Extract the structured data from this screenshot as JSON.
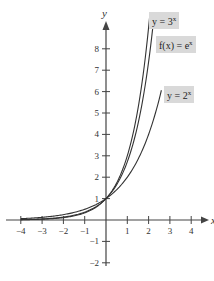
{
  "chart_data": {
    "type": "line",
    "title": "",
    "xlabel": "x",
    "ylabel": "y",
    "xlim": [
      -4.5,
      4.7
    ],
    "ylim": [
      -2.2,
      9.5
    ],
    "x_ticks": [
      -4,
      -3,
      -2,
      -1,
      1,
      2,
      3,
      4
    ],
    "x_tick_labels": [
      "−4",
      "−3",
      "−2",
      "−1",
      "1",
      "2",
      "3",
      "4"
    ],
    "y_ticks": [
      -2,
      -1,
      1,
      2,
      3,
      4,
      5,
      6,
      7,
      8
    ],
    "y_tick_labels": [
      "−2",
      "−1",
      "1",
      "2",
      "3",
      "4",
      "5",
      "6",
      "7",
      "8"
    ],
    "grid": false,
    "legend": "inline labels near curve ends (top right)",
    "series": [
      {
        "name": "y = 3^x",
        "label": "y = 3",
        "exp": "x",
        "base": 3,
        "x_range": [
          -4,
          2.05
        ]
      },
      {
        "name": "f(x) = e^x",
        "label": "f(x) = e",
        "exp": "x",
        "base": 2.718281828,
        "x_range": [
          -4,
          2.2
        ]
      },
      {
        "name": "y = 2^x",
        "label": "y = 2",
        "exp": "x",
        "base": 2,
        "x_range": [
          -4,
          2.6
        ]
      }
    ],
    "colors": {
      "curves": "#333333",
      "axes": "#444444",
      "label_bg": "#d9d9d9"
    }
  }
}
